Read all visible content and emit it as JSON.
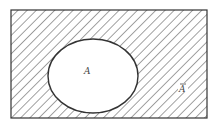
{
  "diagram": {
    "type": "venn",
    "title": "",
    "universe": {
      "x": 11,
      "y": 10,
      "width": 196,
      "height": 108,
      "shaded": true,
      "hatch": "diagonal"
    },
    "set_a": {
      "label": "A",
      "cx": 93,
      "cy": 76,
      "rx": 45,
      "ry": 37,
      "shaded": false
    },
    "complement": {
      "label": "A",
      "overline": true
    },
    "colors": {
      "stroke": "#333333",
      "hatch": "#555555",
      "background": "#ffffff"
    }
  }
}
